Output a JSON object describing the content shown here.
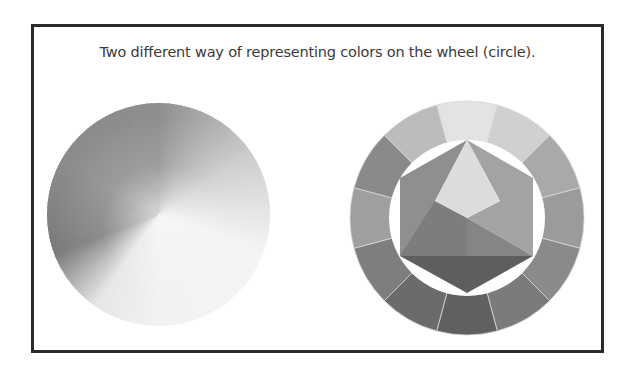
{
  "figure": {
    "caption": "Two different way of representing colors on the wheel (circle).",
    "frame_border_color": "#2b2b2b",
    "background_color": "#ffffff"
  },
  "left_wheel": {
    "kind": "continuous-gradient-color-wheel",
    "rendering": "grayscale",
    "stops": [
      {
        "angle": 0,
        "color": "#8e8e8e"
      },
      {
        "angle": 60,
        "color": "#cfcfcf"
      },
      {
        "angle": 110,
        "color": "#f4f4f4"
      },
      {
        "angle": 180,
        "color": "#f2f2f2"
      },
      {
        "angle": 215,
        "color": "#e6e6e6"
      },
      {
        "angle": 250,
        "color": "#7a7a7a"
      },
      {
        "angle": 300,
        "color": "#8c8c8c"
      },
      {
        "angle": 360,
        "color": "#8e8e8e"
      }
    ],
    "center_highlight": "#f6f6f6"
  },
  "right_wheel": {
    "kind": "segmented-12-part-color-wheel",
    "rendering": "grayscale",
    "ring_segments": [
      {
        "position": 0,
        "color": "#e3e3e3"
      },
      {
        "position": 1,
        "color": "#d0d0d0"
      },
      {
        "position": 2,
        "color": "#a9a9a9"
      },
      {
        "position": 3,
        "color": "#9b9b9b"
      },
      {
        "position": 4,
        "color": "#8a8a8a"
      },
      {
        "position": 5,
        "color": "#7b7b7b"
      },
      {
        "position": 6,
        "color": "#606060"
      },
      {
        "position": 7,
        "color": "#6b6b6b"
      },
      {
        "position": 8,
        "color": "#7e7e7e"
      },
      {
        "position": 9,
        "color": "#9f9f9f"
      },
      {
        "position": 10,
        "color": "#8a8a8a"
      },
      {
        "position": 11,
        "color": "#bcbcbc"
      }
    ],
    "segment_divider_color": "#d8d8d8",
    "inner_gap_color": "#ffffff",
    "hexagon": {
      "primary_triangle_color": "#dcdcdc",
      "upper_left_color": "#8f8f8f",
      "upper_right_color": "#a3a3a3",
      "lower_left_color": "#7d7d7d",
      "lower_right_color": "#858585",
      "bottom_band_color": "#5e5e5e"
    }
  }
}
